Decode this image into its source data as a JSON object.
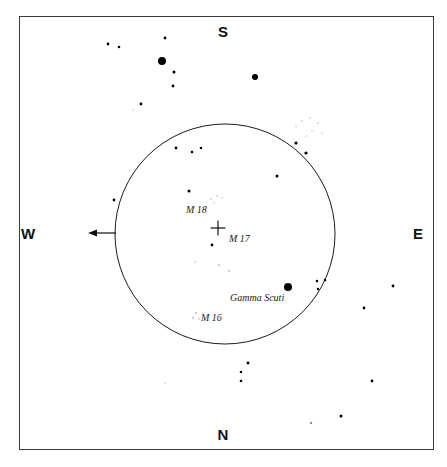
{
  "chart_data": {
    "type": "scatter",
    "title": "",
    "subtitle": "",
    "xlabel": "",
    "ylabel": "",
    "grid": false,
    "legend": "none",
    "projection": "sky-chart",
    "xlim": [
      19,
      434
    ],
    "ylim": [
      16,
      450
    ],
    "note": "Binocular star chart of the Sagittarius/Scutum Milky Way region showing Messier objects M16, M17, M18 and the star Gamma Scuti inside a circular binocular field of view.",
    "field_circle": {
      "cx": 225,
      "cy": 234,
      "r": 110,
      "stroke": "#1a1a1a",
      "stroke_width": 1
    },
    "direction_arrow": {
      "from_x": 116,
      "to_x": 88,
      "y": 233,
      "points": "west",
      "label": "drift direction"
    },
    "center_marker": {
      "shape": "cross",
      "x": 218,
      "y": 228,
      "size": 15,
      "marks": "M 17"
    },
    "annotations": [
      {
        "id": "m18",
        "text": "M 18",
        "x": 186,
        "y": 205
      },
      {
        "id": "m17",
        "text": "M 17",
        "x": 229,
        "y": 234
      },
      {
        "id": "m16",
        "text": "M 16",
        "x": 201,
        "y": 313
      },
      {
        "id": "gamma-scuti",
        "text": "Gamma Scuti",
        "x": 230,
        "y": 293
      }
    ],
    "cardinals": {
      "top": "S",
      "bottom": "N",
      "left": "W",
      "right": "E"
    },
    "stars": [
      {
        "x": 162,
        "y": 61,
        "r": 4.0,
        "mag": "bright"
      },
      {
        "x": 255,
        "y": 77,
        "r": 3.0,
        "mag": "bright"
      },
      {
        "x": 288,
        "y": 287,
        "r": 4.0,
        "mag": "bright"
      },
      {
        "x": 165,
        "y": 38,
        "r": 1.4,
        "mag": "medium"
      },
      {
        "x": 108,
        "y": 44,
        "r": 1.4,
        "mag": "medium"
      },
      {
        "x": 119,
        "y": 47,
        "r": 1.3,
        "mag": "medium"
      },
      {
        "x": 174,
        "y": 72,
        "r": 1.5,
        "mag": "medium"
      },
      {
        "x": 173,
        "y": 86,
        "r": 1.4,
        "mag": "medium"
      },
      {
        "x": 141,
        "y": 104,
        "r": 1.4,
        "mag": "medium"
      },
      {
        "x": 296,
        "y": 143,
        "r": 1.6,
        "mag": "medium"
      },
      {
        "x": 306,
        "y": 153,
        "r": 1.6,
        "mag": "medium"
      },
      {
        "x": 302,
        "y": 121,
        "r": 0.8,
        "mag": "veryfaint"
      },
      {
        "x": 310,
        "y": 118,
        "r": 0.7,
        "mag": "veryfaint"
      },
      {
        "x": 318,
        "y": 123,
        "r": 0.8,
        "mag": "veryfaint"
      },
      {
        "x": 312,
        "y": 131,
        "r": 0.7,
        "mag": "veryfaint"
      },
      {
        "x": 322,
        "y": 133,
        "r": 0.7,
        "mag": "veryfaint"
      },
      {
        "x": 306,
        "y": 136,
        "r": 0.7,
        "mag": "veryfaint"
      },
      {
        "x": 296,
        "y": 126,
        "r": 0.7,
        "mag": "veryfaint"
      },
      {
        "x": 176,
        "y": 148,
        "r": 1.4,
        "mag": "medium"
      },
      {
        "x": 192,
        "y": 152,
        "r": 1.3,
        "mag": "medium"
      },
      {
        "x": 201,
        "y": 148,
        "r": 1.3,
        "mag": "medium"
      },
      {
        "x": 189,
        "y": 191,
        "r": 1.5,
        "mag": "medium"
      },
      {
        "x": 114,
        "y": 200,
        "r": 1.4,
        "mag": "medium"
      },
      {
        "x": 277,
        "y": 176,
        "r": 1.5,
        "mag": "medium"
      },
      {
        "x": 212,
        "y": 245,
        "r": 1.4,
        "mag": "medium"
      },
      {
        "x": 211,
        "y": 199,
        "r": 0.8,
        "mag": "veryfaint"
      },
      {
        "x": 217,
        "y": 196,
        "r": 0.8,
        "mag": "veryfaint"
      },
      {
        "x": 222,
        "y": 198,
        "r": 0.7,
        "mag": "veryfaint"
      },
      {
        "x": 214,
        "y": 203,
        "r": 0.7,
        "mag": "veryfaint"
      },
      {
        "x": 219,
        "y": 265,
        "r": 0.9,
        "mag": "veryfaint"
      },
      {
        "x": 229,
        "y": 271,
        "r": 0.9,
        "mag": "veryfaint"
      },
      {
        "x": 195,
        "y": 262,
        "r": 0.8,
        "mag": "veryfaint"
      },
      {
        "x": 196,
        "y": 313,
        "r": 0.9,
        "mag": "veryfaint"
      },
      {
        "x": 193,
        "y": 318,
        "r": 0.9,
        "mag": "veryfaint"
      },
      {
        "x": 199,
        "y": 319,
        "r": 0.8,
        "mag": "veryfaint"
      },
      {
        "x": 317,
        "y": 281,
        "r": 1.3,
        "mag": "medium"
      },
      {
        "x": 325,
        "y": 280,
        "r": 1.3,
        "mag": "medium"
      },
      {
        "x": 318,
        "y": 289,
        "r": 1.2,
        "mag": "medium"
      },
      {
        "x": 393,
        "y": 286,
        "r": 1.4,
        "mag": "medium"
      },
      {
        "x": 364,
        "y": 308,
        "r": 1.4,
        "mag": "medium"
      },
      {
        "x": 248,
        "y": 363,
        "r": 1.4,
        "mag": "medium"
      },
      {
        "x": 241,
        "y": 372,
        "r": 1.3,
        "mag": "medium"
      },
      {
        "x": 241,
        "y": 381,
        "r": 1.3,
        "mag": "medium"
      },
      {
        "x": 372,
        "y": 381,
        "r": 1.4,
        "mag": "medium"
      },
      {
        "x": 341,
        "y": 416,
        "r": 1.5,
        "mag": "medium"
      },
      {
        "x": 311,
        "y": 423,
        "r": 1.1,
        "mag": "faint"
      },
      {
        "x": 165,
        "y": 383,
        "r": 0.7,
        "mag": "veryfaint"
      },
      {
        "x": 133,
        "y": 110,
        "r": 0.7,
        "mag": "veryfaint"
      }
    ]
  }
}
